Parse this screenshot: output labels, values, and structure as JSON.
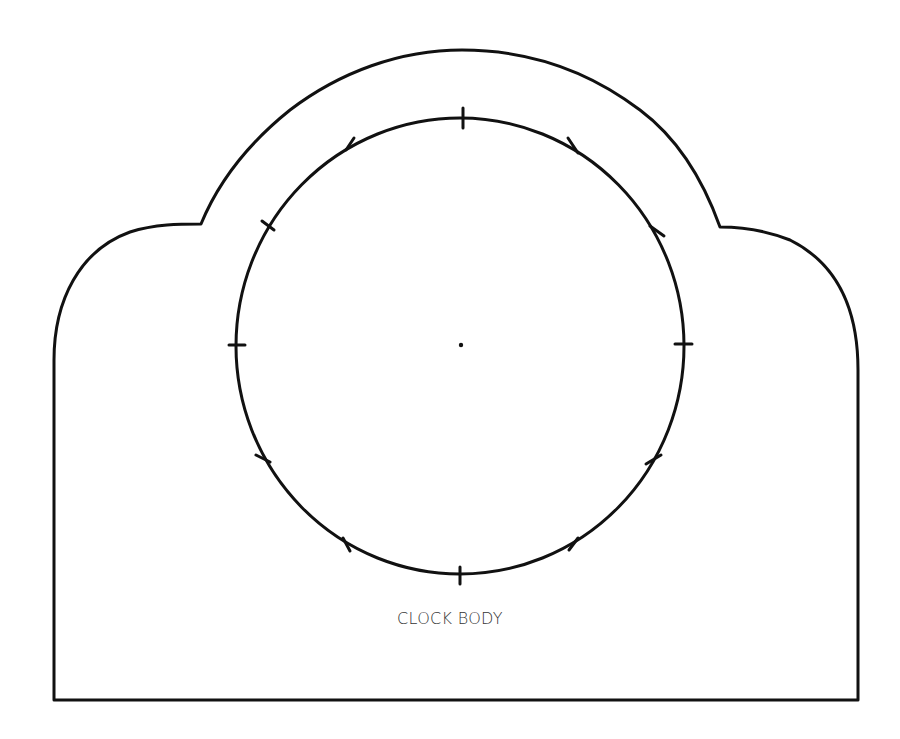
{
  "diagram": {
    "title": "CLOCK BODY",
    "colors": {
      "stroke": "#111111",
      "background": "#ffffff",
      "label": "#333333"
    },
    "outline": {
      "shape": "clock-body-outline",
      "description": "Arched top with rounded shoulders and flat rectangular base"
    },
    "dial": {
      "shape": "circle",
      "center": [
        460,
        346
      ],
      "radius": 226,
      "tick_count": 12,
      "center_mark": "dot"
    }
  }
}
